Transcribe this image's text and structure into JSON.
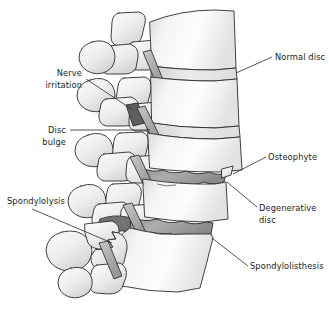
{
  "figure": {
    "background_color": "#ffffff",
    "line_color": "#2d2d2d",
    "text_color": "#1c1c1c"
  },
  "labels": {
    "normal_disc": {
      "text": "Normal disc",
      "align": "left",
      "x": 275,
      "y": 60
    },
    "nerve_irritation_line1": {
      "text": "Nerve",
      "align": "right",
      "x": 82,
      "y": 76
    },
    "nerve_irritation_line2": {
      "text": "irritation",
      "align": "right",
      "x": 82,
      "y": 88
    },
    "disc_bulge_line1": {
      "text": "Disc",
      "align": "right",
      "x": 66,
      "y": 133
    },
    "disc_bulge_line2": {
      "text": "bulge",
      "align": "right",
      "x": 66,
      "y": 145
    },
    "osteophyte": {
      "text": "Osteophyte",
      "align": "left",
      "x": 268,
      "y": 160
    },
    "degenerative_disc_line1": {
      "text": "Degenerative",
      "align": "left",
      "x": 259,
      "y": 211
    },
    "degenerative_disc_line2": {
      "text": "disc",
      "align": "left",
      "x": 259,
      "y": 223
    },
    "spondylolysis": {
      "text": "Spondylolysis",
      "align": "left",
      "x": 7,
      "y": 204
    },
    "spondylolisthesis": {
      "text": "Spondylolisthesis",
      "align": "left",
      "x": 250,
      "y": 269
    }
  },
  "colors": {
    "bone_fill_light": "#fbfbfb",
    "bone_fill_mid": "#ececec",
    "bone_shadow": "#d6d6d6",
    "disc_normal_fill": "#e3e3e3",
    "disc_degenerative_fill": "#a2a2a2",
    "nerve_fill": "#b6b6b6",
    "nerve_dark_fill": "#5a5a5a",
    "outline": "#2d2d2d",
    "text": "#1c1c1c"
  },
  "anatomy": {
    "structures": [
      "vertebral-body-1",
      "vertebral-body-2",
      "vertebral-body-3",
      "vertebral-body-4",
      "vertebral-body-5",
      "normal-intervertebral-disc",
      "bulging-intervertebral-disc",
      "degenerative-disc-upper",
      "degenerative-disc-lower",
      "spinous-process-1",
      "spinous-process-2",
      "spinous-process-3",
      "spinous-process-4",
      "spinous-process-5",
      "nerve-root-1",
      "nerve-root-2",
      "nerve-root-3",
      "nerve-root-4",
      "compressed-nerve-root",
      "osteophyte-spur",
      "pars-fracture",
      "slipped-vertebra"
    ]
  }
}
